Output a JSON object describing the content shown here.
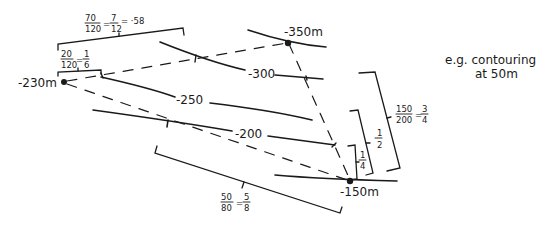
{
  "diagram": {
    "spot_heights": [
      {
        "label": "-230m",
        "x": 63,
        "y": 82
      },
      {
        "label": "-350m",
        "x": 287,
        "y": 42
      },
      {
        "label": "-150m",
        "x": 350,
        "y": 180
      }
    ],
    "contour_labels": [
      "-300",
      "-250",
      "-200"
    ],
    "fractions": {
      "top_long": {
        "num": "70",
        "den": "120",
        "eq": "=",
        "num2": "7",
        "den2": "12",
        "approx": "= ·58"
      },
      "top_short": {
        "num": "20",
        "den": "120",
        "eq": "=",
        "num2": "1",
        "den2": "6"
      },
      "bottom": {
        "num": "50",
        "den": "80",
        "eq": "=",
        "num2": "5",
        "den2": "8"
      },
      "right_outer": {
        "num": "150",
        "den": "200",
        "eq": "=",
        "num2": "3",
        "den2": "4"
      },
      "right_mid": {
        "num2": "1",
        "den2": "2"
      },
      "right_inner": {
        "num2": "1",
        "den2": "4"
      }
    },
    "note": {
      "line1": "e.g.  contouring",
      "line2": "at 50m"
    }
  }
}
